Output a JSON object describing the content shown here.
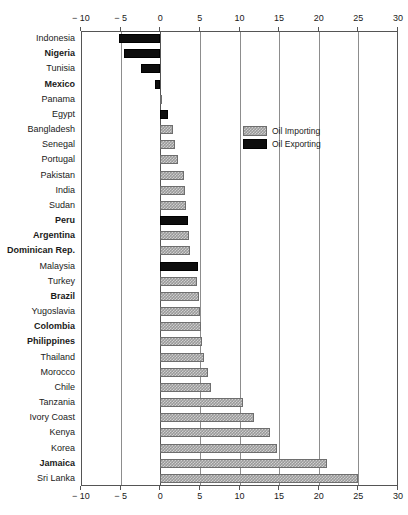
{
  "chart_data": {
    "type": "bar",
    "orientation": "horizontal",
    "title": "",
    "subtitle": "",
    "xlabel": "",
    "ylabel": "",
    "xlim": [
      -10,
      30
    ],
    "xticks": [
      -10,
      -5,
      0,
      5,
      10,
      15,
      20,
      25,
      30
    ],
    "xtick_labels": [
      "− 10",
      "− 5",
      "0",
      "5",
      "10",
      "15",
      "20",
      "25",
      "30"
    ],
    "grid": true,
    "grid_axis": "x",
    "axis_position": "both-top-and-bottom",
    "legend": {
      "position": "upper-right-inside",
      "entries": [
        {
          "label": "Oil Importing",
          "key": "importing",
          "color": "#9a9a9a",
          "pattern": "checker"
        },
        {
          "label": "Oil Exporting",
          "key": "exporting",
          "color": "#0d0d0d",
          "pattern": "solid"
        }
      ]
    },
    "categories": [
      "Indonesia",
      "Nigeria",
      "Tunisia",
      "Mexico",
      "Panama",
      "Egypt",
      "Bangladesh",
      "Senegal",
      "Portugal",
      "Pakistan",
      "India",
      "Sudan",
      "Peru",
      "Argentina",
      "Dominican Rep.",
      "Malaysia",
      "Turkey",
      "Brazil",
      "Yugoslavia",
      "Colombia",
      "Philippines",
      "Thailand",
      "Morocco",
      "Chile",
      "Tanzania",
      "Ivory Coast",
      "Kenya",
      "Korea",
      "Jamaica",
      "Sri Lanka"
    ],
    "values": [
      -5.2,
      -4.6,
      -2.4,
      -0.6,
      0.1,
      1.0,
      1.6,
      1.8,
      2.3,
      3.0,
      3.1,
      3.3,
      3.5,
      3.6,
      3.8,
      4.8,
      4.6,
      4.9,
      5.0,
      5.1,
      5.3,
      5.5,
      6.0,
      6.4,
      10.5,
      11.8,
      13.8,
      14.7,
      21.0,
      25.0
    ],
    "bars": [
      {
        "label": "Indonesia",
        "value": -5.2,
        "series": "exporting",
        "bold": false
      },
      {
        "label": "Nigeria",
        "value": -4.6,
        "series": "exporting",
        "bold": true
      },
      {
        "label": "Tunisia",
        "value": -2.4,
        "series": "exporting",
        "bold": false
      },
      {
        "label": "Mexico",
        "value": -0.6,
        "series": "exporting",
        "bold": true
      },
      {
        "label": "Panama",
        "value": 0.1,
        "series": "importing",
        "bold": false
      },
      {
        "label": "Egypt",
        "value": 1.0,
        "series": "exporting",
        "bold": false
      },
      {
        "label": "Bangladesh",
        "value": 1.6,
        "series": "importing",
        "bold": false
      },
      {
        "label": "Senegal",
        "value": 1.8,
        "series": "importing",
        "bold": false
      },
      {
        "label": "Portugal",
        "value": 2.3,
        "series": "importing",
        "bold": false
      },
      {
        "label": "Pakistan",
        "value": 3.0,
        "series": "importing",
        "bold": false
      },
      {
        "label": "India",
        "value": 3.1,
        "series": "importing",
        "bold": false
      },
      {
        "label": "Sudan",
        "value": 3.3,
        "series": "importing",
        "bold": false
      },
      {
        "label": "Peru",
        "value": 3.5,
        "series": "exporting",
        "bold": true
      },
      {
        "label": "Argentina",
        "value": 3.6,
        "series": "importing",
        "bold": true
      },
      {
        "label": "Dominican Rep.",
        "value": 3.8,
        "series": "importing",
        "bold": true
      },
      {
        "label": "Malaysia",
        "value": 4.8,
        "series": "exporting",
        "bold": false
      },
      {
        "label": "Turkey",
        "value": 4.6,
        "series": "importing",
        "bold": false
      },
      {
        "label": "Brazil",
        "value": 4.9,
        "series": "importing",
        "bold": true
      },
      {
        "label": "Yugoslavia",
        "value": 5.0,
        "series": "importing",
        "bold": false
      },
      {
        "label": "Colombia",
        "value": 5.1,
        "series": "importing",
        "bold": true
      },
      {
        "label": "Philippines",
        "value": 5.3,
        "series": "importing",
        "bold": true
      },
      {
        "label": "Thailand",
        "value": 5.5,
        "series": "importing",
        "bold": false
      },
      {
        "label": "Morocco",
        "value": 6.0,
        "series": "importing",
        "bold": false
      },
      {
        "label": "Chile",
        "value": 6.4,
        "series": "importing",
        "bold": false
      },
      {
        "label": "Tanzania",
        "value": 10.5,
        "series": "importing",
        "bold": false
      },
      {
        "label": "Ivory Coast",
        "value": 11.8,
        "series": "importing",
        "bold": false
      },
      {
        "label": "Kenya",
        "value": 13.8,
        "series": "importing",
        "bold": false
      },
      {
        "label": "Korea",
        "value": 14.7,
        "series": "importing",
        "bold": false
      },
      {
        "label": "Jamaica",
        "value": 21.0,
        "series": "importing",
        "bold": true
      },
      {
        "label": "Sri Lanka",
        "value": 25.0,
        "series": "importing",
        "bold": false
      }
    ]
  }
}
